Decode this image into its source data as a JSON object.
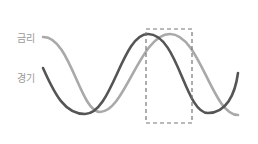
{
  "labels": {
    "rate": "금리",
    "economy": "경기"
  },
  "colors": {
    "rate_curve": "#a9a9a9",
    "economy_curve": "#555555",
    "label_text": "#9a9a9a",
    "highlight_box": "#777777"
  },
  "curves": {
    "rate": {
      "name": "금리",
      "path": "M43,37 C70,36 80,112 100,112 C125,112 140,34 170,34 C200,34 212,115 238,115"
    },
    "economy": {
      "name": "경기",
      "path": "M43,68 C55,95 65,114 85,114 C112,114 122,34 148,34 C178,34 185,113 208,113 C226,113 235,95 238,73"
    }
  },
  "highlight_box": {
    "x": 146,
    "y": 29,
    "width": 46,
    "height": 94
  }
}
